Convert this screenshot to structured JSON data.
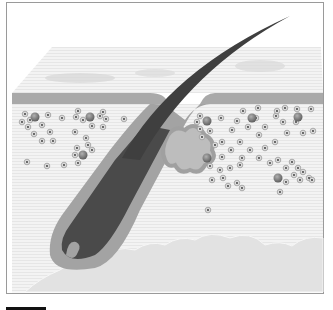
{
  "diagram": {
    "labels": [],
    "colors": {
      "background": "#ffffff",
      "frame": "#9a9a9a",
      "epidermis_surface": "#ececec",
      "epidermis_band": "#a9a9a9",
      "dermis": "#f2f2f2",
      "hair_shaft": "#474747",
      "follicle_sheath": "#a3a3a3",
      "sebaceous_gland": "#bdbdbd",
      "fat_layer": "#e0e0e0",
      "cell": "#d9d9d9",
      "cell_nucleus": "#333333",
      "large_cell": "#7a7a7a",
      "scale_bar": "#111111"
    }
  }
}
